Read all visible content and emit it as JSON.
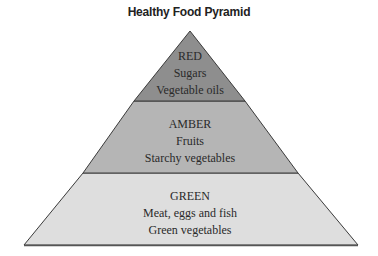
{
  "title": "Healthy Food Pyramid",
  "colors": {
    "red_fill": "#8e8e8e",
    "amber_fill": "#b5b5b5",
    "green_fill": "#dedede",
    "outline": "#3a3a3a"
  },
  "tiers": [
    {
      "name": "RED",
      "items": [
        "Sugars",
        "Vegetable oils"
      ]
    },
    {
      "name": "AMBER",
      "items": [
        "Fruits",
        "Starchy vegetables"
      ]
    },
    {
      "name": "GREEN",
      "items": [
        "Meat, eggs and fish",
        "Green vegetables"
      ]
    }
  ]
}
